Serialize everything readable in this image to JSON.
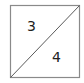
{
  "diagram": {
    "type": "square-split-by-diagonal",
    "square": {
      "x": 10,
      "y": 5,
      "width": 70,
      "height": 73,
      "stroke": "#888888"
    },
    "diagonal": {
      "from": "bottom-left",
      "to": "top-right",
      "stroke": "#555555"
    },
    "regions": [
      {
        "position": "upper-left-triangle",
        "label": "3"
      },
      {
        "position": "lower-right-triangle",
        "label": "4"
      }
    ]
  }
}
